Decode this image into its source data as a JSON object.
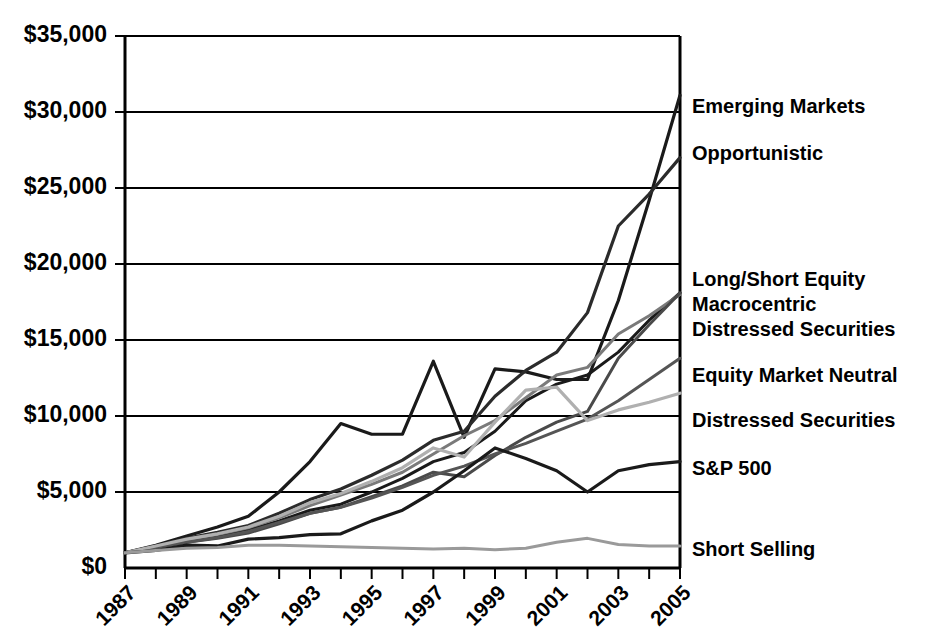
{
  "chart_data": {
    "type": "line",
    "title": "",
    "subtitle": "",
    "xlabel": "",
    "ylabel": "",
    "xlim": [
      1987,
      2005
    ],
    "ylim": [
      0,
      35000
    ],
    "grid": true,
    "legend_position": "right-of-plot-at-series-end",
    "y_tick_labels": [
      "$35,000",
      "$30,000",
      "$25,000",
      "$20,000",
      "$15,000",
      "$10,000",
      "$5,000",
      "$0"
    ],
    "y_tick_values": [
      35000,
      30000,
      25000,
      20000,
      15000,
      10000,
      5000,
      0
    ],
    "x_tick_labels": [
      "1987",
      "1989",
      "1991",
      "1993",
      "1995",
      "1997",
      "1999",
      "2001",
      "2003",
      "2005"
    ],
    "x_tick_values": [
      1987,
      1989,
      1991,
      1993,
      1995,
      1997,
      1999,
      2001,
      2003,
      2005
    ],
    "x_all_ticks": [
      1987,
      1988,
      1989,
      1990,
      1991,
      1992,
      1993,
      1994,
      1995,
      1996,
      1997,
      1998,
      1999,
      2000,
      2001,
      2002,
      2003,
      2004,
      2005
    ],
    "x": [
      1987,
      1988,
      1989,
      1990,
      1991,
      1992,
      1993,
      1994,
      1995,
      1996,
      1997,
      1998,
      1999,
      2000,
      2001,
      2002,
      2003,
      2004,
      2005
    ],
    "series": [
      {
        "name": "Emerging Markets",
        "color": "#1a1a1a",
        "width": 3.2,
        "values": [
          1000,
          1500,
          2100,
          2700,
          3400,
          5000,
          7000,
          9500,
          8800,
          8800,
          13600,
          8600,
          13100,
          12900,
          12400,
          12400,
          17600,
          24200,
          31100
        ]
      },
      {
        "name": "Opportunistic",
        "color": "#2b2b2b",
        "width": 3.2,
        "values": [
          1000,
          1450,
          1950,
          2350,
          2800,
          3600,
          4500,
          5200,
          6100,
          7100,
          8400,
          9000,
          11300,
          13000,
          14200,
          16800,
          22500,
          24600,
          27000
        ]
      },
      {
        "name": "Long/Short Equity",
        "color": "#1a1a1a",
        "width": 3.0,
        "values": [
          1000,
          1400,
          1800,
          2100,
          2500,
          3100,
          3800,
          4200,
          5000,
          5900,
          7000,
          7600,
          9000,
          11000,
          12100,
          12700,
          14200,
          16300,
          18100
        ]
      },
      {
        "name": "Macrocentric",
        "color": "#7a7a7a",
        "width": 3.0,
        "values": [
          1000,
          1400,
          1850,
          2200,
          2650,
          3300,
          4100,
          4800,
          5500,
          6300,
          7500,
          8700,
          9700,
          11200,
          12700,
          13200,
          15400,
          16600,
          18000
        ]
      },
      {
        "name": "Distressed Securities",
        "color": "#4a4a4a",
        "width": 3.0,
        "values": [
          1000,
          1350,
          1700,
          1950,
          2300,
          2900,
          3600,
          4000,
          4700,
          5400,
          6300,
          6000,
          7400,
          8600,
          9600,
          10300,
          13800,
          16000,
          18100
        ]
      },
      {
        "name": "Equity Market Neutral",
        "color": "#555555",
        "width": 3.0,
        "values": [
          1000,
          1350,
          1700,
          2000,
          2400,
          3000,
          3600,
          4000,
          4600,
          5300,
          6100,
          6700,
          7500,
          8200,
          9000,
          9800,
          11000,
          12400,
          13800
        ]
      },
      {
        "name": "Distressed Securities",
        "color": "#b0b0b0",
        "width": 3.2,
        "values": [
          1000,
          1450,
          1900,
          2250,
          2700,
          3400,
          4300,
          4900,
          5700,
          6600,
          7900,
          7300,
          9600,
          11700,
          11900,
          9700,
          10400,
          10900,
          11500
        ]
      },
      {
        "name": "S&P 500",
        "color": "#1a1a1a",
        "width": 3.2,
        "values": [
          1000,
          1150,
          1500,
          1450,
          1900,
          2000,
          2200,
          2250,
          3100,
          3800,
          5000,
          6400,
          7900,
          7200,
          6400,
          5000,
          6400,
          6800,
          7000
        ]
      },
      {
        "name": "Short Selling",
        "color": "#9a9a9a",
        "width": 3.0,
        "values": [
          1000,
          1150,
          1300,
          1350,
          1500,
          1500,
          1450,
          1400,
          1350,
          1300,
          1250,
          1300,
          1200,
          1300,
          1700,
          1950,
          1550,
          1450,
          1450
        ]
      }
    ],
    "legend_entries": [
      {
        "label": "Emerging Markets",
        "y": 108
      },
      {
        "label": "Opportunistic",
        "y": 155
      },
      {
        "label": "Long/Short Equity",
        "y": 281
      },
      {
        "label": "Macrocentric",
        "y": 306
      },
      {
        "label": "Distressed Securities",
        "y": 331
      },
      {
        "label": "Equity Market Neutral",
        "y": 377
      },
      {
        "label": "Distressed Securities",
        "y": 422
      },
      {
        "label": "S&P 500",
        "y": 470
      },
      {
        "label": "Short Selling",
        "y": 551
      }
    ]
  }
}
